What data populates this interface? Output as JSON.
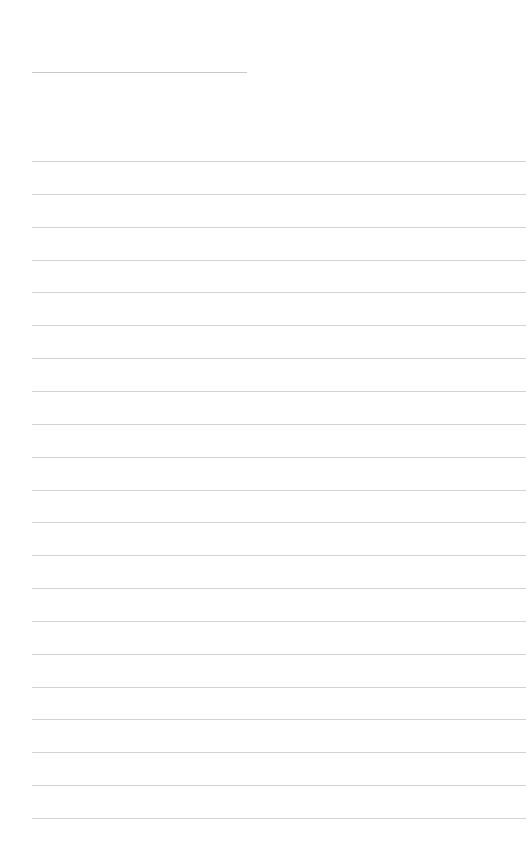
{
  "page": {
    "type": "lined-paper",
    "background": "#ffffff",
    "line_color": "#d2d2d2",
    "title_line": {
      "present": true
    },
    "rule_count": 21
  }
}
